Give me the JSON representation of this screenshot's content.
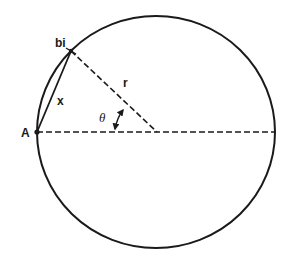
{
  "diagram": {
    "type": "geometry-circle",
    "colors": {
      "stroke": "#1a1a1a",
      "background": "#ffffff"
    },
    "circle": {
      "cx": 156,
      "cy": 132,
      "rx": 119,
      "ry": 116
    },
    "points": {
      "A": {
        "label": "A",
        "x": 37,
        "y": 132
      },
      "bi": {
        "label": "bi",
        "x": 71,
        "y": 51
      },
      "center": {
        "x": 157,
        "y": 132
      }
    },
    "labels": {
      "point_a": "A",
      "point_bi": "bi",
      "chord": "x",
      "radius": "r",
      "angle": "θ"
    },
    "segments": [
      {
        "name": "chord-x",
        "from": "A",
        "to": "bi",
        "style": "solid"
      },
      {
        "name": "radius-r",
        "from": "bi",
        "to": "center",
        "style": "dashed"
      },
      {
        "name": "diameter",
        "from": "A",
        "to": "right-edge",
        "style": "dashed"
      }
    ],
    "angle_arc": {
      "label": "θ",
      "double_arrow": true
    }
  }
}
